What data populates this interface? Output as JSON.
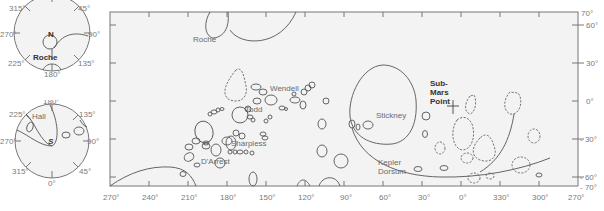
{
  "hemisphere_north": {
    "pole_label": "N",
    "feature_label": "Roche",
    "longitude_ticks": [
      "315°",
      "45°",
      "270°",
      "90°",
      "225°",
      "135°",
      "180°"
    ]
  },
  "hemisphere_south": {
    "pole_label": "S",
    "feature_label": "Hall",
    "longitude_ticks": [
      "180°",
      "225°",
      "135°",
      "270°",
      "90°",
      "315°",
      "45°",
      "0°"
    ]
  },
  "main_map": {
    "x_axis": {
      "ticks": [
        "270°",
        "240°",
        "210°",
        "180°",
        "150°",
        "120°",
        "90°",
        "60°",
        "30°",
        "0°",
        "330°",
        "300°",
        "270°"
      ]
    },
    "y_axis": {
      "ticks": [
        "70°",
        "60°",
        "30°",
        "0°",
        "- 30°",
        "- 60°",
        "- 70°"
      ]
    },
    "features": {
      "roche": "Roche",
      "wendell": "Wendell",
      "todd": "Todd",
      "sharpless": "Sharpless",
      "d_arrest": "D'Arrest",
      "stickney": "Stickney",
      "kepler_1": "Kepler",
      "kepler_2": "Dorsum",
      "submars_1": "Sub-",
      "submars_2": "Mars",
      "submars_3": "Point"
    }
  },
  "colors": {
    "background": "#ffffff",
    "map_fill": "#f3f3f3",
    "outline": "#555555",
    "label": "#6a6a6a"
  }
}
